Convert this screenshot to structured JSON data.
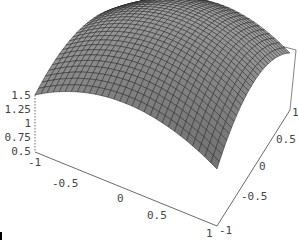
{
  "chart_data": {
    "type": "surface3d",
    "title": "",
    "xlabel": "",
    "ylabel": "",
    "zlabel": "",
    "x_range": [
      -1,
      1
    ],
    "y_range": [
      -1,
      1
    ],
    "z_range": [
      0.5,
      1.5
    ],
    "x_ticks": [
      "-1",
      "-0.5",
      "0",
      "0.5",
      "1"
    ],
    "y_ticks": [
      "-1",
      "-0.5",
      "0",
      "0.5",
      "1"
    ],
    "z_ticks": [
      "0.5",
      "0.75",
      "1",
      "1.25",
      "1.5"
    ],
    "surface_description": "Dome-shaped surface, maximum near 1.5 at center (0,0), falling to about 0.5 at the corners",
    "mesh": "30x30 grid",
    "box": true
  },
  "colors": {
    "surface": "#9a9a9a",
    "mesh": "#222222",
    "box": "#666666",
    "text": "#444444"
  }
}
